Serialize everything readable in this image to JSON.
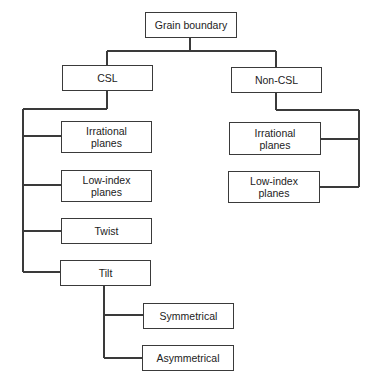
{
  "diagram": {
    "type": "tree",
    "root": {
      "label": "Grain boundary",
      "children": [
        {
          "label": "CSL",
          "children": [
            {
              "label": "Irrational planes"
            },
            {
              "label": "Low-index planes"
            },
            {
              "label": "Twist"
            },
            {
              "label": "Tilt",
              "children": [
                {
                  "label": "Symmetrical"
                },
                {
                  "label": "Asymmetrical"
                }
              ]
            }
          ]
        },
        {
          "label": "Non-CSL",
          "children": [
            {
              "label": "Irrational planes"
            },
            {
              "label": "Low-index planes"
            }
          ]
        }
      ]
    }
  },
  "nodes": {
    "root": {
      "line1": "Grain boundary"
    },
    "csl": {
      "line1": "CSL"
    },
    "non_csl": {
      "line1": "Non-CSL"
    },
    "csl_irrational": {
      "line1": "Irrational",
      "line2": "planes"
    },
    "csl_low_index": {
      "line1": "Low-index",
      "line2": "planes"
    },
    "csl_twist": {
      "line1": "Twist"
    },
    "csl_tilt": {
      "line1": "Tilt"
    },
    "tilt_symmetrical": {
      "line1": "Symmetrical"
    },
    "tilt_asymmetrical": {
      "line1": "Asymmetrical"
    },
    "noncsl_irrational": {
      "line1": "Irrational",
      "line2": "planes"
    },
    "noncsl_low_index": {
      "line1": "Low-index",
      "line2": "planes"
    }
  },
  "colors": {
    "line": "#3a3a3a",
    "text": "#222222",
    "background": "#ffffff"
  }
}
